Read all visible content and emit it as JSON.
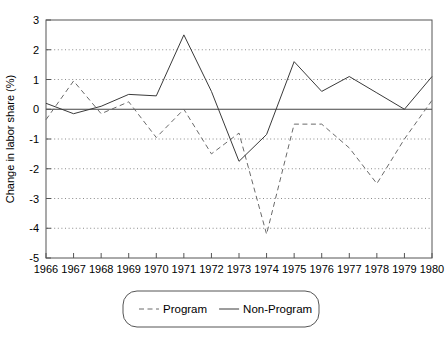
{
  "chart_data": {
    "type": "line",
    "title": "",
    "xlabel": "",
    "ylabel": "Change in labor share (%)",
    "x": [
      1966,
      1967,
      1968,
      1969,
      1970,
      1971,
      1972,
      1973,
      1974,
      1975,
      1976,
      1977,
      1978,
      1979,
      1980
    ],
    "xtick_labels": [
      "1966",
      "1967",
      "1968",
      "1969",
      "1970",
      "1971",
      "1972",
      "1973",
      "1974",
      "1975",
      "1976",
      "1977",
      "1978",
      "1979",
      "1980"
    ],
    "ytick_labels": [
      "3",
      "2",
      "1",
      "0",
      "-1",
      "-2",
      "-3",
      "-4",
      "-5"
    ],
    "yticks": [
      3,
      2,
      1,
      0,
      -1,
      -2,
      -3,
      -4,
      -5
    ],
    "ylim": [
      -5,
      3
    ],
    "xlim": [
      1966,
      1980
    ],
    "grid": true,
    "grid_axis": "y",
    "legend_position": "below-center",
    "series": [
      {
        "name": "Program",
        "style": "dashed",
        "color": "#6a6a6a",
        "values": [
          -0.35,
          0.95,
          -0.15,
          0.25,
          -0.95,
          0.0,
          -1.5,
          -0.8,
          -4.2,
          -0.5,
          -0.5,
          -1.3,
          -2.5,
          -1.0,
          0.3
        ]
      },
      {
        "name": "Non-Program",
        "style": "solid",
        "color": "#3a3a3a",
        "values": [
          0.2,
          -0.15,
          0.1,
          0.5,
          0.45,
          2.5,
          0.6,
          -1.75,
          -0.85,
          1.6,
          0.6,
          1.1,
          0.55,
          0.0,
          1.1
        ]
      }
    ],
    "legend": [
      {
        "label": "Program",
        "style": "dashed"
      },
      {
        "label": "Non-Program",
        "style": "solid"
      }
    ]
  }
}
